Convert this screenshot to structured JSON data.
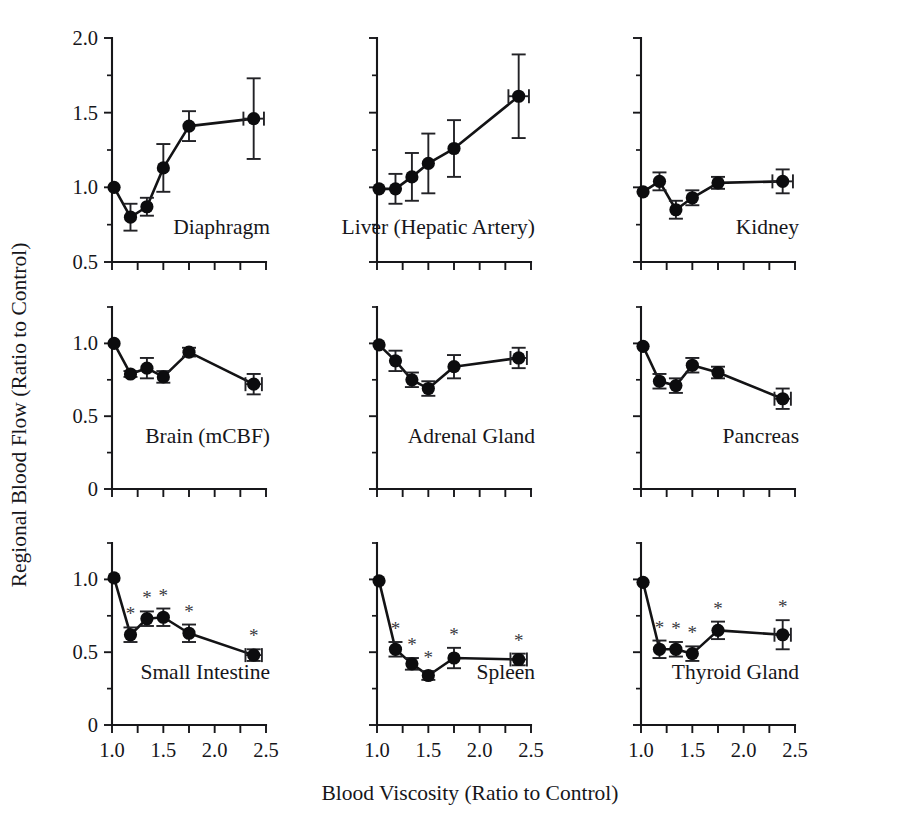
{
  "figure": {
    "ylabel": "Regional Blood Flow (Ratio to Control)",
    "xlabel": "Blood Viscosity (Ratio to Control)",
    "significance_marker": "*"
  },
  "chart_data": {
    "type": "line",
    "title": "",
    "xlabel": "Blood Viscosity (Ratio to Control)",
    "ylabel": "Regional Blood Flow (Ratio to Control)",
    "grid": false,
    "legend": null,
    "layout": {
      "rows": 3,
      "cols": 3
    },
    "x_axis": {
      "lim": [
        1.0,
        2.5
      ],
      "major_ticks": [
        1.0,
        1.5,
        2.0,
        2.5
      ],
      "minor_ticks": [
        1.25,
        1.75,
        2.25
      ],
      "tick_labels": [
        "1.0",
        "1.5",
        "2.0",
        "2.5"
      ]
    },
    "panels": [
      {
        "name": "Diaphragm",
        "row": 0,
        "col": 0,
        "ylim": [
          0.5,
          2.0
        ],
        "y_major_ticks": [
          0.5,
          1.0,
          1.5,
          2.0
        ],
        "y_minor_ticks": [
          0.75,
          1.25,
          1.75
        ],
        "y_tick_labels": [
          "0.5",
          "1.0",
          "1.5",
          "2.0"
        ],
        "x": [
          1.02,
          1.18,
          1.34,
          1.5,
          1.75,
          2.38
        ],
        "y": [
          1.0,
          0.8,
          0.87,
          1.13,
          1.41,
          1.46
        ],
        "yerr": [
          0.0,
          0.09,
          0.06,
          0.16,
          0.1,
          0.27
        ],
        "xerr": [
          0.0,
          0.0,
          0.0,
          0.0,
          0.0,
          0.1
        ],
        "significant": [
          false,
          false,
          false,
          false,
          false,
          false
        ]
      },
      {
        "name": "Liver (Hepatic Artery)",
        "row": 0,
        "col": 1,
        "ylim": [
          0.5,
          2.0
        ],
        "y_major_ticks": [
          0.5,
          1.0,
          1.5,
          2.0
        ],
        "y_minor_ticks": [
          0.75,
          1.25,
          1.75
        ],
        "y_tick_labels": [
          "0.5",
          "1.0",
          "1.5",
          "2.0"
        ],
        "x": [
          1.02,
          1.18,
          1.34,
          1.5,
          1.75,
          2.38
        ],
        "y": [
          0.99,
          0.99,
          1.07,
          1.16,
          1.26,
          1.61
        ],
        "yerr": [
          0.0,
          0.1,
          0.16,
          0.2,
          0.19,
          0.28
        ],
        "xerr": [
          0.0,
          0.0,
          0.0,
          0.0,
          0.0,
          0.1
        ],
        "significant": [
          false,
          false,
          false,
          false,
          false,
          false
        ]
      },
      {
        "name": "Kidney",
        "row": 0,
        "col": 2,
        "ylim": [
          0.5,
          2.0
        ],
        "y_major_ticks": [
          0.5,
          1.0,
          1.5,
          2.0
        ],
        "y_minor_ticks": [
          0.75,
          1.25,
          1.75
        ],
        "y_tick_labels": [
          "0.5",
          "1.0",
          "1.5",
          "2.0"
        ],
        "x": [
          1.02,
          1.18,
          1.34,
          1.5,
          1.75,
          2.38
        ],
        "y": [
          0.97,
          1.04,
          0.85,
          0.93,
          1.03,
          1.04
        ],
        "yerr": [
          0.0,
          0.06,
          0.06,
          0.05,
          0.04,
          0.08
        ],
        "xerr": [
          0.0,
          0.0,
          0.0,
          0.0,
          0.0,
          0.1
        ],
        "significant": [
          false,
          false,
          false,
          false,
          false,
          false
        ]
      },
      {
        "name": "Brain (mCBF)",
        "row": 1,
        "col": 0,
        "ylim": [
          0.0,
          1.25
        ],
        "y_major_ticks": [
          0.0,
          0.5,
          1.0
        ],
        "y_minor_ticks": [
          0.25,
          0.75,
          1.25
        ],
        "y_tick_labels": [
          "0",
          "0.5",
          "1.0"
        ],
        "x": [
          1.02,
          1.18,
          1.34,
          1.5,
          1.75,
          2.38
        ],
        "y": [
          1.0,
          0.79,
          0.83,
          0.77,
          0.94,
          0.72
        ],
        "yerr": [
          0.0,
          0.02,
          0.07,
          0.04,
          0.03,
          0.07
        ],
        "xerr": [
          0.0,
          0.0,
          0.0,
          0.0,
          0.0,
          0.08
        ],
        "significant": [
          false,
          false,
          false,
          false,
          false,
          false
        ]
      },
      {
        "name": "Adrenal Gland",
        "row": 1,
        "col": 1,
        "ylim": [
          0.0,
          1.25
        ],
        "y_major_ticks": [
          0.0,
          0.5,
          1.0
        ],
        "y_minor_ticks": [
          0.25,
          0.75,
          1.25
        ],
        "y_tick_labels": [
          "0",
          "0.5",
          "1.0"
        ],
        "x": [
          1.02,
          1.18,
          1.34,
          1.5,
          1.75,
          2.38
        ],
        "y": [
          0.99,
          0.88,
          0.75,
          0.69,
          0.84,
          0.9
        ],
        "yerr": [
          0.0,
          0.07,
          0.05,
          0.05,
          0.08,
          0.07
        ],
        "xerr": [
          0.0,
          0.0,
          0.0,
          0.0,
          0.0,
          0.08
        ],
        "significant": [
          false,
          false,
          false,
          false,
          false,
          false
        ]
      },
      {
        "name": "Pancreas",
        "row": 1,
        "col": 2,
        "ylim": [
          0.0,
          1.25
        ],
        "y_major_ticks": [
          0.0,
          0.5,
          1.0
        ],
        "y_minor_ticks": [
          0.25,
          0.75,
          1.25
        ],
        "y_tick_labels": [
          "0",
          "0.5",
          "1.0"
        ],
        "x": [
          1.02,
          1.18,
          1.34,
          1.5,
          1.75,
          2.38
        ],
        "y": [
          0.98,
          0.74,
          0.71,
          0.85,
          0.8,
          0.62
        ],
        "yerr": [
          0.0,
          0.05,
          0.05,
          0.05,
          0.04,
          0.07
        ],
        "xerr": [
          0.0,
          0.0,
          0.0,
          0.0,
          0.0,
          0.08
        ],
        "significant": [
          false,
          false,
          false,
          false,
          false,
          false
        ]
      },
      {
        "name": "Small Intestine",
        "row": 2,
        "col": 0,
        "ylim": [
          0.0,
          1.25
        ],
        "y_major_ticks": [
          0.0,
          0.5,
          1.0
        ],
        "y_minor_ticks": [
          0.25,
          0.75,
          1.25
        ],
        "y_tick_labels": [
          "0",
          "0.5",
          "1.0"
        ],
        "x": [
          1.02,
          1.18,
          1.34,
          1.5,
          1.75,
          2.38
        ],
        "y": [
          1.01,
          0.62,
          0.73,
          0.74,
          0.63,
          0.48
        ],
        "yerr": [
          0.0,
          0.05,
          0.05,
          0.06,
          0.06,
          0.04
        ],
        "xerr": [
          0.0,
          0.0,
          0.0,
          0.0,
          0.0,
          0.08
        ],
        "significant": [
          false,
          true,
          true,
          true,
          true,
          true
        ]
      },
      {
        "name": "Spleen",
        "row": 2,
        "col": 1,
        "ylim": [
          0.0,
          1.25
        ],
        "y_major_ticks": [
          0.0,
          0.5,
          1.0
        ],
        "y_minor_ticks": [
          0.25,
          0.75,
          1.25
        ],
        "y_tick_labels": [
          "0",
          "0.5",
          "1.0"
        ],
        "x": [
          1.02,
          1.18,
          1.34,
          1.5,
          1.75,
          2.38
        ],
        "y": [
          0.99,
          0.52,
          0.42,
          0.34,
          0.46,
          0.45
        ],
        "yerr": [
          0.0,
          0.05,
          0.04,
          0.03,
          0.07,
          0.04
        ],
        "xerr": [
          0.0,
          0.0,
          0.0,
          0.0,
          0.0,
          0.08
        ],
        "significant": [
          false,
          true,
          true,
          true,
          true,
          true
        ]
      },
      {
        "name": "Thyroid Gland",
        "row": 2,
        "col": 2,
        "ylim": [
          0.0,
          1.25
        ],
        "y_major_ticks": [
          0.0,
          0.5,
          1.0
        ],
        "y_minor_ticks": [
          0.25,
          0.75,
          1.25
        ],
        "y_tick_labels": [
          "0",
          "0.5",
          "1.0"
        ],
        "x": [
          1.02,
          1.18,
          1.34,
          1.5,
          1.75,
          2.38
        ],
        "y": [
          0.98,
          0.52,
          0.52,
          0.49,
          0.65,
          0.62
        ],
        "yerr": [
          0.0,
          0.06,
          0.05,
          0.05,
          0.06,
          0.1
        ],
        "xerr": [
          0.0,
          0.0,
          0.0,
          0.0,
          0.0,
          0.08
        ],
        "significant": [
          false,
          true,
          true,
          true,
          true,
          true
        ]
      }
    ]
  }
}
